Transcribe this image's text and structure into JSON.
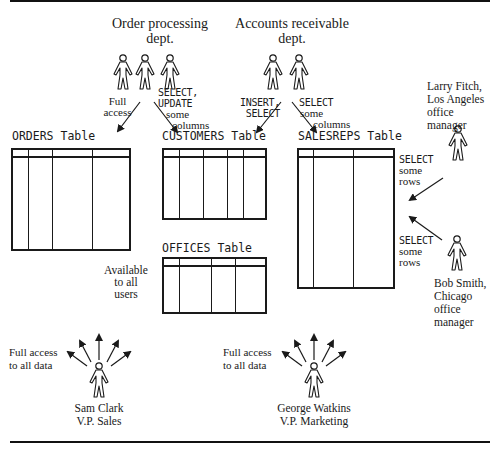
{
  "diagram": {
    "groups": {
      "order_processing": {
        "label_line1": "Order processing",
        "label_line2": "dept."
      },
      "accounts_receivable": {
        "label_line1": "Accounts receivable",
        "label_line2": "dept."
      }
    },
    "tables": {
      "orders": {
        "name": "ORDERS Table"
      },
      "customers": {
        "name": "CUSTOMERS Table"
      },
      "salesreps": {
        "name": "SALESREPS Table"
      },
      "offices": {
        "name": "OFFICES Table"
      }
    },
    "access_labels": {
      "full_access": {
        "line1": "Full",
        "line2": "access"
      },
      "select_update": {
        "line1": "SELECT,",
        "line2": "UPDATE",
        "line3": "some",
        "line4": "columns"
      },
      "insert_select": {
        "line1": "INSERT,",
        "line2": "SELECT"
      },
      "select_some_columns": {
        "line1": "SELECT",
        "line2": "some",
        "line3": "columns"
      },
      "select_some_rows_1": {
        "line1": "SELECT",
        "line2": "some",
        "line3": "rows"
      },
      "select_some_rows_2": {
        "line1": "SELECT",
        "line2": "some",
        "line3": "rows"
      },
      "available_all": {
        "line1": "Available",
        "line2": "to all",
        "line3": "users"
      },
      "full_all_data_1": {
        "line1": "Full access",
        "line2": "to all data"
      },
      "full_all_data_2": {
        "line1": "Full access",
        "line2": "to all data"
      }
    },
    "people": {
      "larry_fitch": {
        "line1": "Larry Fitch,",
        "line2": "Los Angeles",
        "line3": "office",
        "line4": "manager"
      },
      "bob_smith": {
        "line1": "Bob Smith,",
        "line2": "Chicago",
        "line3": "office",
        "line4": "manager"
      },
      "sam_clark": {
        "line1": "Sam Clark",
        "line2": "V.P. Sales"
      },
      "george_watkins": {
        "line1": "George Watkins",
        "line2": "V.P. Marketing"
      }
    },
    "caption": {
      "text": ""
    }
  }
}
